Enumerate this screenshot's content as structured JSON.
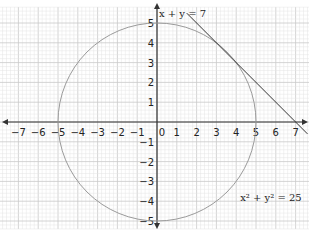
{
  "chart_data": {
    "type": "line",
    "title": "",
    "xlabel": "",
    "ylabel": "",
    "xlim": [
      -8,
      7.6
    ],
    "ylim": [
      -5.4,
      5.8
    ],
    "grid": true,
    "x_ticks": [
      "−7",
      "−6",
      "−5",
      "−4",
      "−3",
      "−2",
      "−1",
      "0",
      "1",
      "2",
      "3",
      "4",
      "5",
      "6",
      "7"
    ],
    "y_ticks": [
      "5",
      "4",
      "3",
      "2",
      "1",
      "−1",
      "−2",
      "−3",
      "−4",
      "−5"
    ],
    "x_tick_values": [
      -7,
      -6,
      -5,
      -4,
      -3,
      -2,
      -1,
      0,
      1,
      2,
      3,
      4,
      5,
      6,
      7
    ],
    "y_tick_values": [
      5,
      4,
      3,
      2,
      1,
      -1,
      -2,
      -3,
      -4,
      -5
    ],
    "series": [
      {
        "name": "x² + y² = 25",
        "kind": "circle",
        "center": [
          0,
          0
        ],
        "radius": 5,
        "color": "#9a9a9a"
      },
      {
        "name": "x + y = 7",
        "kind": "line",
        "x": [
          1.5,
          7.6
        ],
        "y": [
          5.5,
          -0.6
        ],
        "color": "#333333"
      }
    ],
    "annotations": [
      {
        "text": "x + y = 7",
        "x": 0.1,
        "y": 5.3
      },
      {
        "text": "x² + y² = 25",
        "x": 4.2,
        "y": -4.0
      }
    ]
  },
  "labels": {
    "line_eq": "x + y = 7",
    "circle_eq": "x² + y² = 25"
  },
  "colors": {
    "grid_minor": "#e4e4e4",
    "grid_major": "#c9c9c9",
    "axis": "#333333",
    "circle": "#9a9a9a",
    "line": "#333333"
  }
}
